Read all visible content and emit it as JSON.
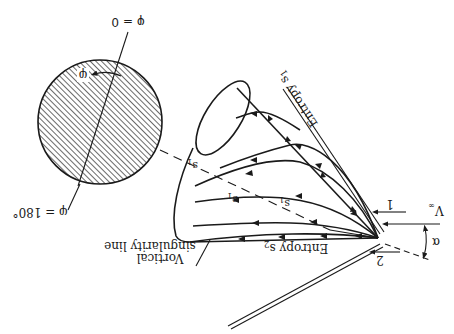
{
  "figure": {
    "orientation": "rotated 180 degrees",
    "labels": {
      "phi_zero": "φ = 0",
      "phi_180": "φ = 180°",
      "phi": "φ",
      "v_inf": "V",
      "v_inf_sub": "∞",
      "alpha": "α",
      "streamline_1": "1",
      "streamline_2": "2",
      "entropy_s1": "Entropy s",
      "entropy_s1_sub": "1",
      "entropy_s2": "Entropy s",
      "entropy_s2_sub": "2",
      "s1_a": "s",
      "s1_a_sub": "1",
      "s1_b": "s",
      "s1_b_sub": "1",
      "vortical_line1": "Vortical",
      "vortical_line2": "singularity line"
    },
    "colors": {
      "ink": "#1a1a1a",
      "background": "#ffffff"
    }
  }
}
